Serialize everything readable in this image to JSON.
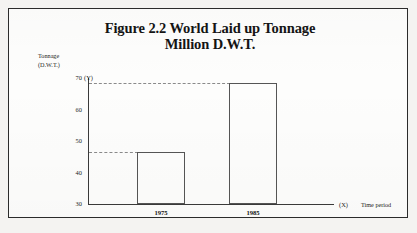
{
  "figure": {
    "title_line1": "Figure 2.2 World Laid up Tonnage",
    "title_line2": "Million D.W.T.",
    "y_caption_line1": "Tonnage",
    "y_caption_line2": "(D.W.T.)",
    "y_axis_marker": "(Y)",
    "x_axis_marker": "(X)",
    "x_caption": "Time period"
  },
  "chart_data": {
    "type": "bar",
    "title": "Figure 2.2 World Laid up Tonnage Million D.W.T.",
    "categories": [
      "1975",
      "1985"
    ],
    "values": [
      46.5,
      68.5
    ],
    "xlabel": "Time period",
    "ylabel": "Tonnage (D.W.T.)",
    "ylim": [
      30,
      70
    ],
    "yticks": [
      "70",
      "60",
      "50",
      "40",
      "30"
    ],
    "ytick_values": [
      70,
      60,
      50,
      40,
      30
    ],
    "grid": false,
    "legend": "none",
    "bar_style": "outlined-unfilled",
    "reference_lines": "dashed horizontal from y-axis to each bar top",
    "axis_markers": {
      "y": "(Y)",
      "x": "(X)"
    },
    "colors": {
      "bar_outline": "#555555",
      "axis": "#3a3a3a",
      "reference_line": "#8a8a8a",
      "text": "#141414",
      "frame": "#2b2b2b",
      "background": "#fdfdfc"
    }
  }
}
